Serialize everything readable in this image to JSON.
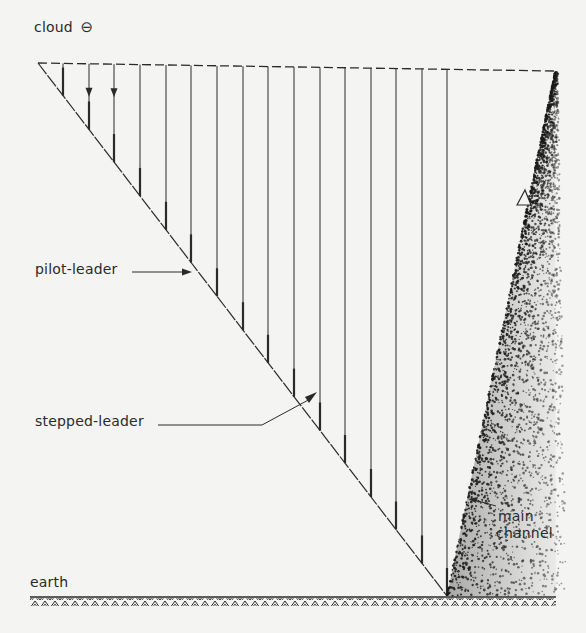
{
  "diagram": {
    "labels": {
      "cloud": "cloud",
      "cloud_charge": "⊖",
      "pilot_leader": "pilot-leader",
      "stepped_leader": "stepped-leader",
      "main_channel_line1": "main",
      "main_channel_line2": "channel",
      "earth": "earth"
    },
    "geometry": {
      "cloud_line_y": 63,
      "cloud_line_x_start": 38,
      "cloud_line_x_end": 555,
      "ground_y": 597,
      "ground_x_start": 30,
      "ground_x_end": 556,
      "diagonal": {
        "x1": 38,
        "y1": 63,
        "x2": 447,
        "y2": 596
      },
      "vertical_line_xs": [
        63,
        89,
        114,
        140,
        166,
        191,
        217,
        243,
        268,
        294,
        320,
        345,
        371,
        396,
        422,
        447
      ],
      "arrow_leaders_count": 3,
      "main_channel": {
        "top": [
          555,
          72
        ],
        "bottom_left": [
          447,
          596
        ],
        "bottom_right": [
          556,
          596
        ]
      }
    },
    "colors": {
      "ink": "#2a2a2a",
      "paper": "#f4f4f2",
      "stipple": "#1a1a1a"
    }
  }
}
